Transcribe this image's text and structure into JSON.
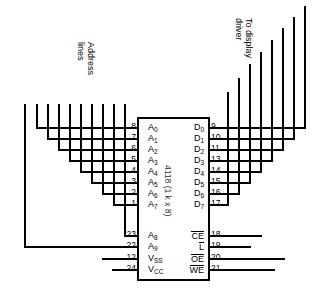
{
  "diagram": {
    "chip": {
      "part_number": "4118",
      "organization": "(1 k x 8)",
      "center_label": "4118 (1 k x 8)"
    },
    "annotations": {
      "address_lines": {
        "line1": "Address",
        "line2": "lines"
      },
      "display_driver": {
        "line1": "To display",
        "line2": "driver"
      }
    },
    "left_pins": [
      {
        "number": "8",
        "signal": "A",
        "sub": "0",
        "overline": false
      },
      {
        "number": "7",
        "signal": "A",
        "sub": "1",
        "overline": false
      },
      {
        "number": "6",
        "signal": "A",
        "sub": "2",
        "overline": false
      },
      {
        "number": "5",
        "signal": "A",
        "sub": "3",
        "overline": false
      },
      {
        "number": "4",
        "signal": "A",
        "sub": "4",
        "overline": false
      },
      {
        "number": "3",
        "signal": "A",
        "sub": "5",
        "overline": false
      },
      {
        "number": "2",
        "signal": "A",
        "sub": "6",
        "overline": false
      },
      {
        "number": "1",
        "signal": "A",
        "sub": "7",
        "overline": false
      },
      {
        "number": "23",
        "signal": "A",
        "sub": "8",
        "overline": false
      },
      {
        "number": "22",
        "signal": "A",
        "sub": "9",
        "overline": false
      },
      {
        "number": "12",
        "signal": "V",
        "sub": "SS",
        "overline": false
      },
      {
        "number": "24",
        "signal": "V",
        "sub": "CC",
        "overline": false
      }
    ],
    "right_pins": [
      {
        "number": "9",
        "signal": "D",
        "sub": "0",
        "overline": false
      },
      {
        "number": "10",
        "signal": "D",
        "sub": "1",
        "overline": false
      },
      {
        "number": "11",
        "signal": "D",
        "sub": "2",
        "overline": false
      },
      {
        "number": "13",
        "signal": "D",
        "sub": "3",
        "overline": false
      },
      {
        "number": "14",
        "signal": "D",
        "sub": "4",
        "overline": false
      },
      {
        "number": "15",
        "signal": "D",
        "sub": "5",
        "overline": false
      },
      {
        "number": "16",
        "signal": "D",
        "sub": "6",
        "overline": false
      },
      {
        "number": "17",
        "signal": "D",
        "sub": "7",
        "overline": false
      },
      {
        "number": "18",
        "signal": "CE",
        "sub": "",
        "overline": true
      },
      {
        "number": "19",
        "signal": "L",
        "sub": "",
        "overline": true
      },
      {
        "number": "20",
        "signal": "OE",
        "sub": "",
        "overline": true
      },
      {
        "number": "21",
        "signal": "WE",
        "sub": "",
        "overline": true
      }
    ],
    "colors": {
      "ink": "#000000",
      "background": "#ffffff"
    }
  }
}
